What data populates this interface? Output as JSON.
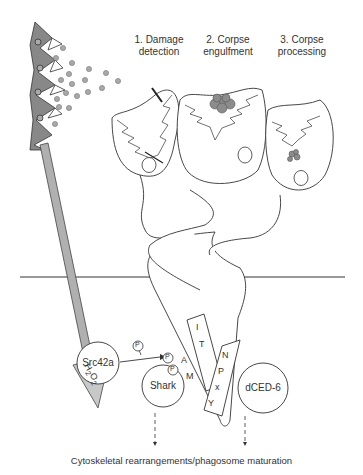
{
  "steps": [
    {
      "line1": "1. Damage",
      "line2": "detection"
    },
    {
      "line1": "2. Corpse",
      "line2": "engulfment"
    },
    {
      "line1": "3. Corpse",
      "line2": "processing"
    }
  ],
  "signal": {
    "molecule": "H2O2",
    "sub1": "2",
    "sub2": "2"
  },
  "proteins": {
    "src": "Src42a",
    "shark": "Shark",
    "dced6": "dCED-6",
    "phospho": "P"
  },
  "motifs": {
    "itam": [
      "I",
      "T",
      "A",
      "M"
    ],
    "npxy": [
      "N",
      "P",
      "x",
      "Y"
    ]
  },
  "outcome": "Cytoskeletal rearrangements/phagosome maturation",
  "colors": {
    "stroke": "#222222",
    "fill_grey": "#999999",
    "arrow_grey": "#aaaaaa",
    "dot": "#a0a0a0"
  }
}
